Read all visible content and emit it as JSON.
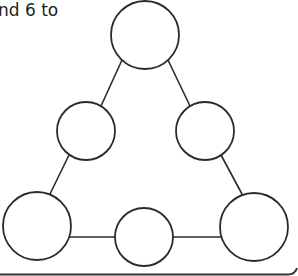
{
  "caption": "nd 6 to",
  "diagram": {
    "stroke": "#2a2a2a",
    "bottom_border": "#333333",
    "nodes": [
      {
        "id": "top",
        "cx": 145,
        "cy": 35,
        "r": 34
      },
      {
        "id": "mid-left",
        "cx": 86,
        "cy": 131,
        "r": 29
      },
      {
        "id": "mid-right",
        "cx": 205,
        "cy": 131,
        "r": 29
      },
      {
        "id": "bottom-left",
        "cx": 37,
        "cy": 226,
        "r": 34
      },
      {
        "id": "bottom-mid",
        "cx": 144,
        "cy": 237,
        "r": 29
      },
      {
        "id": "bottom-right",
        "cx": 254,
        "cy": 227,
        "r": 34
      }
    ]
  }
}
